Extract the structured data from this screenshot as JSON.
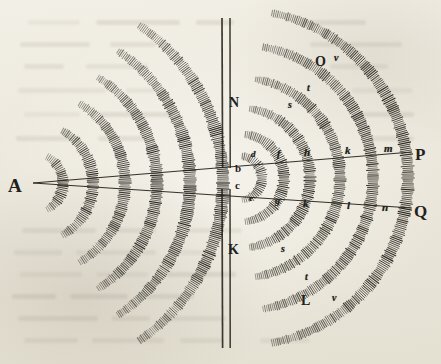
{
  "figure": {
    "ink_color": "#23201a",
    "paper_color": "#efece2",
    "width": 441,
    "height": 364
  },
  "labels": {
    "source": {
      "text": "A",
      "x": 8,
      "y": 176,
      "size": 19,
      "style": "roman"
    },
    "barrier_top": {
      "text": "N",
      "x": 229,
      "y": 96,
      "size": 14,
      "style": "roman"
    },
    "barrier_bottom": {
      "text": "K",
      "x": 228,
      "y": 243,
      "size": 14,
      "style": "roman"
    },
    "aperture_upper": {
      "text": "b",
      "x": 235,
      "y": 163,
      "size": 11,
      "style": "roman"
    },
    "aperture_lower": {
      "text": "c",
      "x": 235,
      "y": 180,
      "size": 11,
      "style": "roman"
    },
    "ray_upper_end": {
      "text": "P",
      "x": 415,
      "y": 146,
      "size": 17,
      "style": "roman"
    },
    "ray_lower_end": {
      "text": "Q",
      "x": 414,
      "y": 203,
      "size": 17,
      "style": "roman"
    },
    "outer_upper": {
      "text": "O",
      "x": 315,
      "y": 55,
      "size": 14,
      "style": "roman"
    },
    "outer_lower": {
      "text": "L",
      "x": 301,
      "y": 294,
      "size": 14,
      "style": "roman"
    }
  },
  "arc_letters": [
    {
      "text": "d",
      "x": 251,
      "y": 150,
      "size": 9,
      "style": "italic"
    },
    {
      "text": "e",
      "x": 249,
      "y": 194,
      "size": 9,
      "style": "italic"
    },
    {
      "text": "f",
      "x": 277,
      "y": 149,
      "size": 10,
      "style": "italic"
    },
    {
      "text": "g",
      "x": 275,
      "y": 196,
      "size": 10,
      "style": "italic"
    },
    {
      "text": "h",
      "x": 304,
      "y": 147,
      "size": 11,
      "style": "italic"
    },
    {
      "text": "k",
      "x": 303,
      "y": 198,
      "size": 11,
      "style": "italic"
    },
    {
      "text": "k",
      "x": 345,
      "y": 145,
      "size": 11,
      "style": "italic"
    },
    {
      "text": "l",
      "x": 347,
      "y": 200,
      "size": 11,
      "style": "italic"
    },
    {
      "text": "m",
      "x": 384,
      "y": 143,
      "size": 11,
      "style": "italic"
    },
    {
      "text": "n",
      "x": 382,
      "y": 202,
      "size": 11,
      "style": "italic"
    },
    {
      "text": "s",
      "x": 288,
      "y": 100,
      "size": 10,
      "style": "italic"
    },
    {
      "text": "t",
      "x": 307,
      "y": 83,
      "size": 10,
      "style": "italic"
    },
    {
      "text": "v",
      "x": 334,
      "y": 53,
      "size": 10,
      "style": "italic"
    },
    {
      "text": "s",
      "x": 281,
      "y": 244,
      "size": 10,
      "style": "italic"
    },
    {
      "text": "t",
      "x": 305,
      "y": 272,
      "size": 10,
      "style": "italic"
    },
    {
      "text": "v",
      "x": 332,
      "y": 293,
      "size": 10,
      "style": "italic"
    }
  ],
  "geometry": {
    "source_point": {
      "x": 33,
      "y": 183
    },
    "aperture_center": {
      "x": 240,
      "y": 178
    },
    "barrier_line_1_x": 222,
    "barrier_line_2_x": 230,
    "barrier_top_y": 18,
    "barrier_bottom_y": 348,
    "ray_upper": {
      "x1": 33,
      "y1": 183,
      "x2": 412,
      "y2": 152
    },
    "ray_lower": {
      "x1": 33,
      "y1": 183,
      "x2": 412,
      "y2": 208
    },
    "left_arc_radii": [
      30,
      60,
      92,
      124,
      157,
      190
    ],
    "left_arc_band_width": 11,
    "left_arc_half_angle_deg": 62,
    "right_arc_radii": [
      22,
      44,
      70,
      100,
      133,
      168
    ],
    "right_arc_band_width": 11,
    "right_arc_half_angle_deg": 84
  },
  "ghost_text_lines": [
    {
      "x": 28,
      "y": 20,
      "w": 52
    },
    {
      "x": 96,
      "y": 20,
      "w": 84
    },
    {
      "x": 196,
      "y": 20,
      "w": 38
    },
    {
      "x": 300,
      "y": 20,
      "w": 66
    },
    {
      "x": 20,
      "y": 42,
      "w": 70
    },
    {
      "x": 110,
      "y": 42,
      "w": 46
    },
    {
      "x": 310,
      "y": 42,
      "w": 92
    },
    {
      "x": 24,
      "y": 64,
      "w": 40
    },
    {
      "x": 86,
      "y": 64,
      "w": 62
    },
    {
      "x": 330,
      "y": 64,
      "w": 58
    },
    {
      "x": 18,
      "y": 88,
      "w": 88
    },
    {
      "x": 126,
      "y": 88,
      "w": 34
    },
    {
      "x": 352,
      "y": 88,
      "w": 60
    },
    {
      "x": 24,
      "y": 112,
      "w": 56
    },
    {
      "x": 100,
      "y": 112,
      "w": 72
    },
    {
      "x": 360,
      "y": 112,
      "w": 54
    },
    {
      "x": 16,
      "y": 136,
      "w": 64
    },
    {
      "x": 98,
      "y": 136,
      "w": 50
    },
    {
      "x": 368,
      "y": 136,
      "w": 46
    },
    {
      "x": 22,
      "y": 228,
      "w": 74
    },
    {
      "x": 112,
      "y": 228,
      "w": 44
    },
    {
      "x": 186,
      "y": 228,
      "w": 56
    },
    {
      "x": 14,
      "y": 250,
      "w": 48
    },
    {
      "x": 76,
      "y": 250,
      "w": 80
    },
    {
      "x": 172,
      "y": 250,
      "w": 40
    },
    {
      "x": 20,
      "y": 272,
      "w": 62
    },
    {
      "x": 96,
      "y": 272,
      "w": 52
    },
    {
      "x": 166,
      "y": 272,
      "w": 70
    },
    {
      "x": 12,
      "y": 294,
      "w": 44
    },
    {
      "x": 70,
      "y": 294,
      "w": 58
    },
    {
      "x": 146,
      "y": 294,
      "w": 48
    },
    {
      "x": 18,
      "y": 316,
      "w": 80
    },
    {
      "x": 112,
      "y": 316,
      "w": 38
    },
    {
      "x": 164,
      "y": 316,
      "w": 62
    },
    {
      "x": 24,
      "y": 338,
      "w": 54
    },
    {
      "x": 92,
      "y": 338,
      "w": 72
    },
    {
      "x": 180,
      "y": 338,
      "w": 42
    },
    {
      "x": 260,
      "y": 338,
      "w": 50
    }
  ]
}
